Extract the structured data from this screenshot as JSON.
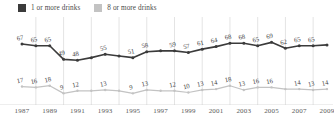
{
  "legend": {
    "position": "top-left",
    "items": [
      {
        "label": "1 or more drinks",
        "swatch_name": "legend-swatch-dark",
        "color": "#3b3b3b"
      },
      {
        "label": "8 or more drinks",
        "swatch_name": "legend-swatch-light",
        "color": "#c3c3c3"
      }
    ]
  },
  "chart_data": {
    "type": "line",
    "title": "",
    "subtitle": "",
    "xlabel": "",
    "ylabel": "",
    "grid": "vertical",
    "legend_position": "top-left",
    "ylim": [
      0,
      80
    ],
    "x": [
      1987,
      1988,
      1989,
      1990,
      1991,
      1992,
      1993,
      1994,
      1995,
      1996,
      1997,
      1998,
      1999,
      2000,
      2001,
      2002,
      2003,
      2004,
      2005,
      2006,
      2007,
      2008,
      2009
    ],
    "xticks": [
      "1987",
      "1989",
      "1991",
      "1993",
      "1995",
      "1997",
      "1999",
      "2001",
      "2003",
      "2005",
      "2007",
      "2009"
    ],
    "series": [
      {
        "name": "1 or more drinks",
        "color": "#3b3b3b",
        "values": [
          67,
          65,
          65,
          49,
          48,
          51,
          55,
          53,
          51,
          58,
          59,
          59,
          57,
          61,
          64,
          68,
          68,
          65,
          69,
          62,
          65,
          65,
          66
        ],
        "labels": [
          "67",
          "65",
          "65",
          "49",
          "48",
          "",
          "55",
          "",
          "51",
          "58",
          "",
          "59",
          "57",
          "61",
          "64",
          "68",
          "68",
          "65",
          "69",
          "62",
          "65",
          "65",
          ""
        ]
      },
      {
        "name": "8 or more drinks",
        "color": "#c3c3c3",
        "values": [
          17,
          16,
          18,
          9,
          12,
          12,
          13,
          12,
          9,
          13,
          12,
          12,
          10,
          13,
          14,
          18,
          13,
          16,
          16,
          14,
          14,
          13,
          14
        ],
        "labels": [
          "17",
          "16",
          "18",
          "9",
          "12",
          "",
          "13",
          "",
          "9",
          "13",
          "",
          "12",
          "10",
          "13",
          "14",
          "18",
          "13",
          "16",
          "16",
          "",
          "14",
          "13",
          "14"
        ]
      }
    ]
  }
}
